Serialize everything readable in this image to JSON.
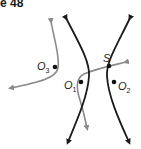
{
  "figure": {
    "title": "e 48",
    "colors": {
      "hyperbola": "#1a1a1a",
      "curve": "#8a8a8a",
      "point": "#111111"
    },
    "points": [
      {
        "id": "O3",
        "label": "O",
        "sub": "3"
      },
      {
        "id": "O1",
        "label": "O",
        "sub": "1"
      },
      {
        "id": "O2",
        "label": "O",
        "sub": "2"
      },
      {
        "id": "S",
        "label": "S"
      }
    ],
    "curves": {
      "hyperbola_left": "left branch of hyperbola",
      "hyperbola_right": "right branch of hyperbola",
      "gray_curve_o3": "curve near O3",
      "gray_curve_o1": "curve near O1 through S"
    }
  }
}
